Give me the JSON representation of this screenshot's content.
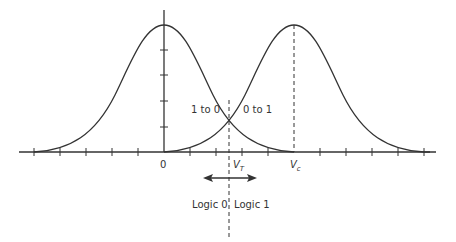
{
  "diagram": {
    "type": "two overlapping gaussian distributions with threshold",
    "labels": {
      "origin": "0",
      "vt": "V",
      "vt_sub": "T",
      "vc": "V",
      "vc_sub": "c",
      "left_overlap": "1 to 0",
      "right_overlap": "0 to 1",
      "logic0": "Logic 0",
      "logic1": "Logic 1"
    },
    "curves": [
      {
        "name": "logic-0-distribution",
        "center": "0"
      },
      {
        "name": "logic-1-distribution",
        "center": "Vc"
      }
    ],
    "colors": {
      "line": "#333333",
      "background": "#ffffff"
    }
  }
}
